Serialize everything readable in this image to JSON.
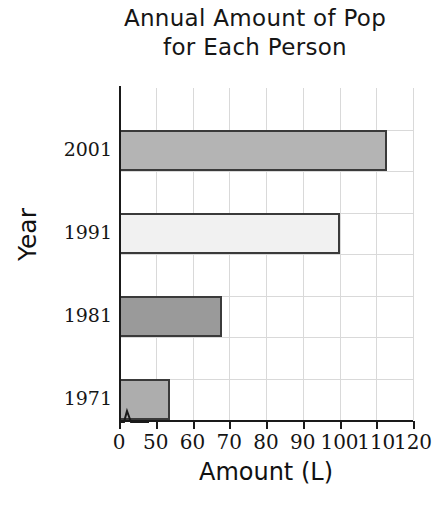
{
  "chart_data": {
    "type": "bar",
    "orientation": "horizontal",
    "title": "Annual Amount of Pop for Each Person",
    "title_lines": [
      "Annual Amount of Pop",
      "for Each Person"
    ],
    "xlabel": "Amount (L)",
    "ylabel": "Year",
    "categories": [
      "2001",
      "1991",
      "1981",
      "1971"
    ],
    "values": [
      113,
      100,
      68,
      54
    ],
    "xticks": [
      "0",
      "50",
      "60",
      "70",
      "80",
      "90",
      "100",
      "110",
      "120"
    ],
    "xtick_values": [
      0,
      50,
      60,
      70,
      80,
      90,
      100,
      110,
      120
    ],
    "xlim": [
      50,
      120
    ],
    "axis_break": true,
    "axis_break_note": "x-axis broken between 0 and 50",
    "grid": true,
    "legend": "none",
    "bar_colors": [
      "#b4b4b4",
      "#f1f1f1",
      "#9a9a9a",
      "#adadad"
    ],
    "bar_border_color": "#3a3a3a"
  },
  "bars": [
    {
      "category": "2001",
      "value": 113,
      "fill": "#b4b4b4"
    },
    {
      "category": "1991",
      "value": 100,
      "fill": "#f1f1f1"
    },
    {
      "category": "1981",
      "value": 68,
      "fill": "#9a9a9a"
    },
    {
      "category": "1971",
      "value": 54,
      "fill": "#adadad"
    }
  ]
}
